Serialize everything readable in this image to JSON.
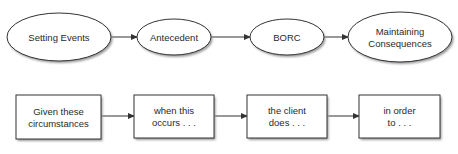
{
  "diagram": {
    "top_row": {
      "shape": "ellipse",
      "nodes": [
        {
          "id": "setting-events",
          "lines": [
            "Setting Events"
          ],
          "cx": 59,
          "cy": 37,
          "rx": 52,
          "ry": 24
        },
        {
          "id": "antecedent",
          "lines": [
            "Antecedent"
          ],
          "cx": 174,
          "cy": 37,
          "rx": 37,
          "ry": 18
        },
        {
          "id": "borc",
          "lines": [
            "BORC"
          ],
          "cx": 287,
          "cy": 37,
          "rx": 37,
          "ry": 18
        },
        {
          "id": "maintaining-consequences",
          "lines": [
            "Maintaining",
            "Consequences"
          ],
          "cx": 400,
          "cy": 37,
          "rx": 52,
          "ry": 25
        }
      ],
      "edges": [
        {
          "from": "setting-events",
          "to": "antecedent",
          "x1": 111,
          "x2": 137,
          "y": 37
        },
        {
          "from": "antecedent",
          "to": "borc",
          "x1": 211,
          "x2": 250,
          "y": 37
        },
        {
          "from": "borc",
          "to": "maintaining-consequences",
          "x1": 324,
          "x2": 348,
          "y": 37
        }
      ]
    },
    "bottom_row": {
      "shape": "rectangle",
      "nodes": [
        {
          "id": "given-these-circumstances",
          "lines": [
            "Given these",
            "circumstances"
          ],
          "x": 16,
          "y": 95,
          "w": 85,
          "h": 44
        },
        {
          "id": "when-this-occurs",
          "lines": [
            "when this",
            "occurs . . ."
          ],
          "x": 134,
          "y": 95,
          "w": 80,
          "h": 43
        },
        {
          "id": "the-client-does",
          "lines": [
            "the client",
            "does . . ."
          ],
          "x": 247,
          "y": 95,
          "w": 80,
          "h": 43
        },
        {
          "id": "in-order-to",
          "lines": [
            "in order",
            "to . . ."
          ],
          "x": 359,
          "y": 95,
          "w": 81,
          "h": 43
        }
      ],
      "edges": [
        {
          "from": "given-these-circumstances",
          "to": "when-this-occurs",
          "x1": 101,
          "x2": 134,
          "y": 116
        },
        {
          "from": "when-this-occurs",
          "to": "the-client-does",
          "x1": 214,
          "x2": 247,
          "y": 116
        },
        {
          "from": "the-client-does",
          "to": "in-order-to",
          "x1": 327,
          "x2": 359,
          "y": 116
        }
      ]
    },
    "colors": {
      "stroke": "#333333",
      "fill": "#ffffff",
      "shadow": "#9a9a9a",
      "text": "#2a2a2a"
    }
  }
}
